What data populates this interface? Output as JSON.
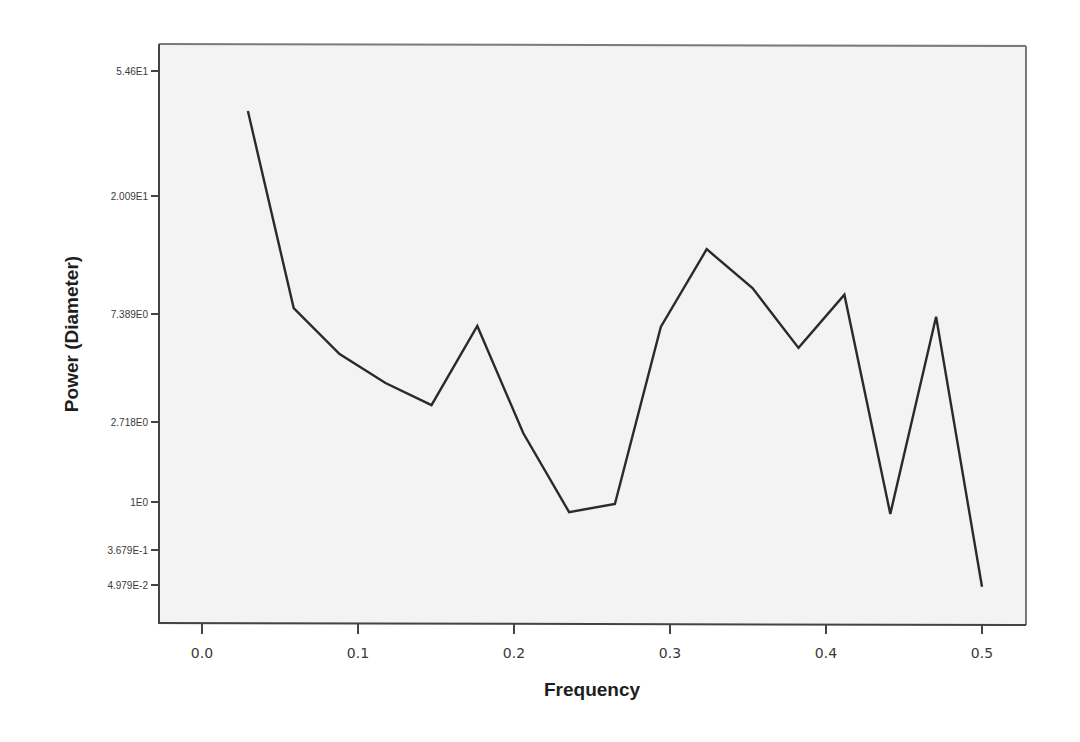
{
  "chart_data": {
    "type": "line",
    "title": "",
    "xlabel": "Frequency",
    "ylabel": "Power (Diameter)",
    "x_ticks": [
      "0.0",
      "0.1",
      "0.2",
      "0.3",
      "0.4",
      "0.5"
    ],
    "x_tick_values": [
      0.0,
      0.1,
      0.2,
      0.3,
      0.4,
      0.5
    ],
    "y_ticks": [
      "5.46E1",
      "2.009E1",
      "7.389E0",
      "2.718E0",
      "1E0",
      "3.679E-1",
      "4.979E-2"
    ],
    "y_tick_values": [
      54.6,
      20.09,
      7.389,
      2.718,
      1.0,
      0.3679,
      0.04979
    ],
    "y_scale": "log-like (ticks at e^4, e^3, e^2, e^1, e^0, e^-1, e^-3)",
    "xlim": [
      -0.03,
      0.53
    ],
    "grid": false,
    "legend": null,
    "series": [
      {
        "name": "Power (Diameter)",
        "color": "#2a2a2a",
        "x": [
          0.0294,
          0.0588,
          0.0882,
          0.1176,
          0.1471,
          0.1765,
          0.2059,
          0.2353,
          0.2647,
          0.2941,
          0.3235,
          0.3529,
          0.3824,
          0.4118,
          0.4412,
          0.4706,
          0.5
        ],
        "values": [
          39.6,
          7.77,
          5.1,
          3.9,
          3.18,
          6.61,
          2.37,
          0.81,
          0.96,
          6.55,
          12.8,
          9.2,
          5.4,
          8.7,
          0.78,
          7.2,
          0.045
        ]
      }
    ]
  },
  "axes": {
    "x_title": "Frequency",
    "y_title": "Power (Diameter)"
  },
  "style": {
    "plot_background": "#f3f3f3",
    "frame_color": "#555555",
    "line_color": "#2a2a2a",
    "page_background": "#ffffff"
  }
}
